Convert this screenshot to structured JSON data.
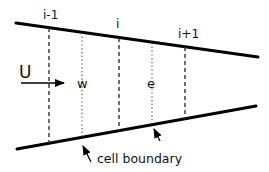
{
  "diagram": {
    "labels": {
      "index_left": "i-1",
      "index_center": "i",
      "index_right": "i+1",
      "velocity": "U",
      "west_face": "w",
      "east_face": "e",
      "annotation": "cell boundary"
    },
    "colors": {
      "stroke": "#000000",
      "text": "#111111",
      "background": "#ffffff"
    },
    "elements": {
      "top_wall": {
        "x1": 16,
        "y1": 23,
        "x2": 258,
        "y2": 57
      },
      "bottom_wall": {
        "x1": 17,
        "y1": 149,
        "x2": 256,
        "y2": 106
      },
      "node_lines_dashed": [
        {
          "name": "i-1",
          "x": 49
        },
        {
          "name": "i",
          "x": 119
        },
        {
          "name": "i+1",
          "x": 185
        }
      ],
      "face_lines_dotted": [
        {
          "name": "w",
          "x": 82
        },
        {
          "name": "e",
          "x": 152
        }
      ]
    }
  }
}
